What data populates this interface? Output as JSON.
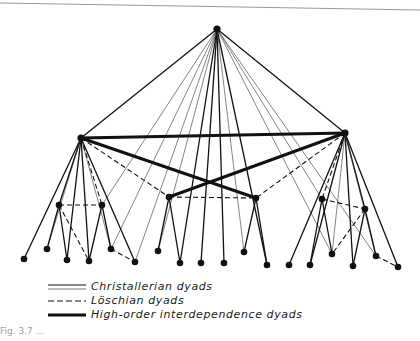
{
  "figure": {
    "legend": [
      {
        "key": "christallerian",
        "label": "Christallerian dyads",
        "style": "double-thin"
      },
      {
        "key": "loschian",
        "label": "Löschian dyads",
        "style": "dashed"
      },
      {
        "key": "high_order",
        "label": "High-order interdependence dyads",
        "style": "thick"
      }
    ],
    "caption": "Fig. 3.7 ...",
    "colors": {
      "ink": "#111111",
      "rule": "#9a9a9a",
      "background": "#ffffff"
    }
  },
  "graph": {
    "nodes": {
      "T": [
        217,
        29
      ],
      "L": [
        81,
        138
      ],
      "R": [
        345,
        133
      ],
      "lm1": [
        59,
        205
      ],
      "lm2": [
        102,
        205
      ],
      "cm1": [
        169,
        197
      ],
      "cm2": [
        256,
        198
      ],
      "rm1": [
        322,
        199
      ],
      "rm2": [
        365,
        209
      ],
      "lb1": [
        24,
        259
      ],
      "lb2": [
        47,
        249
      ],
      "lb3": [
        67,
        260
      ],
      "lb4": [
        89,
        261
      ],
      "lb5": [
        111,
        249
      ],
      "lb6": [
        135,
        262
      ],
      "cb1": [
        158,
        251
      ],
      "cb2": [
        180,
        263
      ],
      "cb3": [
        201,
        263
      ],
      "cb4": [
        224,
        263
      ],
      "cb5": [
        244,
        252
      ],
      "cb6": [
        267,
        265
      ],
      "rb1": [
        289,
        265
      ],
      "rb2": [
        310,
        265
      ],
      "rb3": [
        332,
        254
      ],
      "rb4": [
        353,
        266
      ],
      "rb5": [
        376,
        256
      ],
      "rb6": [
        398,
        267
      ]
    },
    "edges": [
      [
        "T",
        "L",
        "c"
      ],
      [
        "T",
        "R",
        "c"
      ],
      [
        "T",
        "cb2",
        "c"
      ],
      [
        "T",
        "cb3",
        "c"
      ],
      [
        "T",
        "cb4",
        "c"
      ],
      [
        "T",
        "cb6",
        "c"
      ],
      [
        "T",
        "lm2",
        "t"
      ],
      [
        "T",
        "lb5",
        "t"
      ],
      [
        "T",
        "cb1",
        "t"
      ],
      [
        "T",
        "cb5",
        "t"
      ],
      [
        "T",
        "rm1",
        "t"
      ],
      [
        "T",
        "rb5",
        "t"
      ],
      [
        "T",
        "lb6",
        "t"
      ],
      [
        "T",
        "rb3",
        "t"
      ],
      [
        "L",
        "R",
        "h"
      ],
      [
        "L",
        "cm2",
        "h"
      ],
      [
        "R",
        "cm1",
        "h"
      ],
      [
        "L",
        "lb1",
        "c"
      ],
      [
        "L",
        "lb3",
        "c"
      ],
      [
        "L",
        "lb4",
        "c"
      ],
      [
        "L",
        "lb6",
        "c"
      ],
      [
        "L",
        "lm1",
        "c"
      ],
      [
        "L",
        "lb2",
        "t"
      ],
      [
        "L",
        "lb5",
        "t"
      ],
      [
        "L",
        "lm2",
        "d"
      ],
      [
        "L",
        "cm1",
        "d"
      ],
      [
        "lm1",
        "lm2",
        "d"
      ],
      [
        "lm1",
        "lb2",
        "c"
      ],
      [
        "lm1",
        "lb3",
        "c"
      ],
      [
        "lm1",
        "lb4",
        "d"
      ],
      [
        "lm2",
        "lb4",
        "c"
      ],
      [
        "lm2",
        "lb5",
        "c"
      ],
      [
        "lb5",
        "lb6",
        "d"
      ],
      [
        "cm1",
        "cm2",
        "d"
      ],
      [
        "cm1",
        "cb1",
        "c"
      ],
      [
        "cm1",
        "cb2",
        "c"
      ],
      [
        "cm2",
        "cb5",
        "c"
      ],
      [
        "cm2",
        "cb6",
        "c"
      ],
      [
        "R",
        "rb1",
        "c"
      ],
      [
        "R",
        "rb2",
        "c"
      ],
      [
        "R",
        "rb4",
        "c"
      ],
      [
        "R",
        "rb6",
        "c"
      ],
      [
        "R",
        "rm2",
        "c"
      ],
      [
        "R",
        "rb3",
        "t"
      ],
      [
        "R",
        "rb5",
        "t"
      ],
      [
        "R",
        "rm1",
        "d"
      ],
      [
        "R",
        "cm2",
        "d"
      ],
      [
        "rm1",
        "rm2",
        "d"
      ],
      [
        "rm1",
        "rb2",
        "c"
      ],
      [
        "rm1",
        "rb3",
        "c"
      ],
      [
        "rm2",
        "rb3",
        "d"
      ],
      [
        "rm2",
        "rb4",
        "c"
      ],
      [
        "rm2",
        "rb5",
        "c"
      ],
      [
        "rb5",
        "rb6",
        "d"
      ]
    ]
  }
}
